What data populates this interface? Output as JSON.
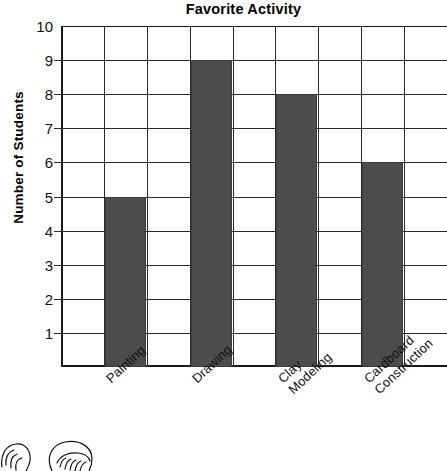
{
  "chart_data": {
    "type": "bar",
    "title": "Favorite Activity",
    "xlabel": "Activity",
    "ylabel": "Number of Students",
    "categories": [
      "Painting",
      "Drawing",
      "Clay Modeling",
      "Cardboard Construction"
    ],
    "values": [
      5,
      9,
      8,
      6
    ],
    "ylim": [
      0,
      10
    ],
    "ytick_labels": [
      "10",
      "9",
      "8",
      "7",
      "6",
      "5",
      "4",
      "3",
      "2",
      "1"
    ],
    "ytick_values": [
      10,
      9,
      8,
      7,
      6,
      5,
      4,
      3,
      2,
      1
    ],
    "grid": true,
    "legend": "none",
    "bar_color": "#4c4c4c",
    "axis_color": "#1b1b1b",
    "grid_color": "#2b2b2b"
  },
  "category_lines": [
    {
      "line1": "Painting",
      "line2": ""
    },
    {
      "line1": "Drawing",
      "line2": ""
    },
    {
      "line1": "Clay",
      "line2": "Modeling"
    },
    {
      "line1": "Cardboard",
      "line2": "Construction"
    }
  ],
  "decoration": {
    "clipart_name": "two-childrens-heads-partial"
  }
}
